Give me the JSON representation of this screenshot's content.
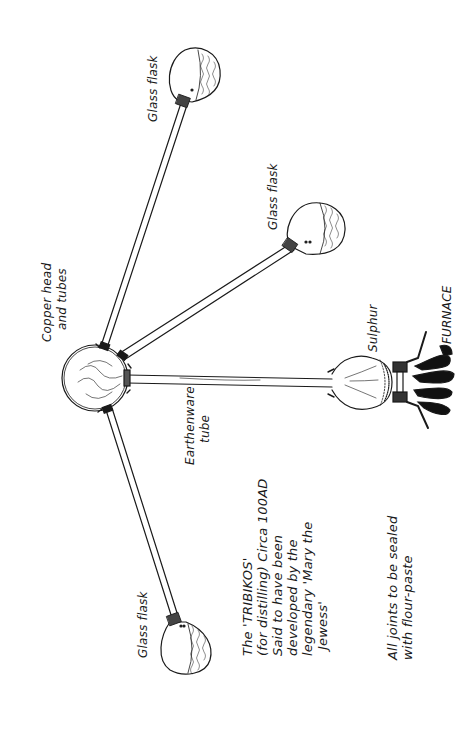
{
  "diagram": {
    "title": "The 'TRIBIKOS'",
    "description_lines": [
      "The 'TRIBIKOS'",
      "(for distilling) Circa 100AD",
      "Said to have been",
      "developed by the",
      "legendary 'Mary the",
      "Jewess'"
    ],
    "note_lines": [
      "All joints to be sealed",
      "with flour-paste"
    ],
    "labels": {
      "flask_top": "Glass flask",
      "flask_right": "Glass flask",
      "flask_bottom": "Glass flask",
      "head_line1": "Copper head",
      "head_line2": "and tubes",
      "tube_line1": "Earthenware",
      "tube_line2": "tube",
      "sulphur": "Sulphur",
      "furnace": "FURNACE"
    },
    "colors": {
      "ink": "#1a1a1a",
      "background": "#ffffff"
    }
  }
}
